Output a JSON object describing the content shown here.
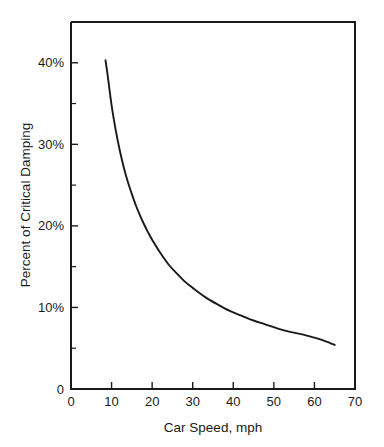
{
  "chart_data": {
    "type": "line",
    "title": "",
    "xlabel": "Car Speed, mph",
    "ylabel": "Percent of Critical Damping",
    "xlim": [
      0,
      70
    ],
    "ylim": [
      0,
      45
    ],
    "grid": false,
    "legend": null,
    "x_ticks": [
      0,
      10,
      20,
      30,
      40,
      50,
      60,
      70
    ],
    "x_tick_labels": [
      "0",
      "10",
      "20",
      "30",
      "40",
      "50",
      "60",
      "70"
    ],
    "y_ticks": [
      0,
      10,
      20,
      30,
      40
    ],
    "y_tick_labels": [
      "0",
      "10%",
      "20%",
      "30%",
      "40%"
    ],
    "y_minor_ticks": [
      5,
      15,
      25,
      35
    ],
    "series": [
      {
        "name": "Percent of Critical Damping vs Car Speed",
        "x": [
          8.5,
          9,
          10,
          11,
          12,
          13,
          14,
          15,
          16,
          17,
          18,
          19,
          20,
          22,
          24,
          26,
          28,
          30,
          33,
          36,
          39,
          42,
          45,
          48,
          51,
          54,
          57,
          60,
          62,
          64,
          65
        ],
        "y": [
          40.3,
          38.6,
          34.8,
          31.8,
          29.3,
          27.2,
          25.4,
          23.9,
          22.5,
          21.3,
          20.2,
          19.2,
          18.3,
          16.7,
          15.3,
          14.2,
          13.2,
          12.4,
          11.3,
          10.4,
          9.6,
          9.0,
          8.4,
          7.9,
          7.4,
          7.0,
          6.7,
          6.3,
          6.0,
          5.6,
          5.4
        ]
      }
    ],
    "annotations": []
  },
  "figure": {
    "background_color": "#ffffff",
    "curve_color": "#1a1a1a",
    "axis_color": "#1a1a1a"
  }
}
